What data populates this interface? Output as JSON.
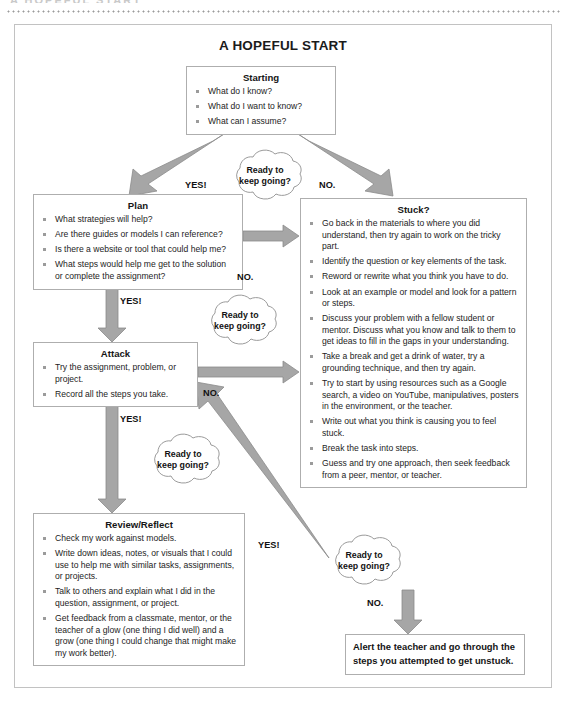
{
  "page": {
    "top_cut_text": "A HOPEFUL START",
    "title": "A HOPEFUL START"
  },
  "nodes": {
    "starting": {
      "title": "Starting",
      "items": [
        "What do I know?",
        "What do I want to know?",
        "What can I assume?"
      ]
    },
    "plan": {
      "title": "Plan",
      "items": [
        "What strategies will help?",
        "Are there guides or models I can reference?",
        "Is there a website or tool that could help me?",
        "What steps would help me get to the solution or complete the assignment?"
      ]
    },
    "stuck": {
      "title": "Stuck?",
      "items": [
        "Go back in the materials to where you did understand, then try again to work on the tricky part.",
        "Identify the question or key elements of the task.",
        "Reword or rewrite what you think you have to do.",
        "Look at an example or model and look for a pattern or steps.",
        "Discuss your problem with a fellow student or mentor. Discuss what you know and talk to them to get ideas to fill in the gaps in your understanding.",
        "Take a break and get a drink of water, try a grounding technique, and then try again.",
        "Try to start by using resources such as a Google search, a video on YouTube, manipulatives, posters in the environment, or the teacher.",
        "Write out what you think is causing you to feel stuck.",
        "Break the task into steps.",
        "Guess and try one approach, then seek feedback from a peer, mentor, or teacher."
      ]
    },
    "attack": {
      "title": "Attack",
      "items": [
        "Try the assignment, problem, or project.",
        "Record all the steps you take."
      ]
    },
    "review": {
      "title": "Review/Reflect",
      "items": [
        "Check my work against models.",
        "Write down ideas, notes, or visuals that I could use to help me with similar tasks, assignments, or projects.",
        "Talk to others and explain what I did in the question, assignment, or project.",
        "Get feedback from a classmate, mentor, or the teacher of a glow (one thing I did well) and a grow (one thing I could change that might make my work better)."
      ]
    },
    "alert": {
      "text": "Alert the teacher and go through the steps you attempted to get unstuck."
    }
  },
  "clouds": [
    {
      "line1": "Ready to",
      "line2": "keep going?"
    },
    {
      "line1": "Ready to",
      "line2": "keep going?"
    },
    {
      "line1": "Ready to",
      "line2": "keep going?"
    },
    {
      "line1": "Ready to",
      "line2": "keep going?"
    }
  ],
  "edge_labels": {
    "starting_yes": "YES!",
    "starting_no": "NO.",
    "plan_no": "NO.",
    "plan_yes": "YES!",
    "attack_no": "NO.",
    "attack_yes": "YES!",
    "review_yes": "YES!",
    "review_no": "NO."
  },
  "colors": {
    "arrow_fill": "#a6a6a6",
    "arrow_stroke": "#8f8f8f",
    "box_border": "#aeaeae",
    "bullet": "#9b9b9b",
    "text": "#1d1d1d",
    "frame": "#c2c2c2"
  }
}
